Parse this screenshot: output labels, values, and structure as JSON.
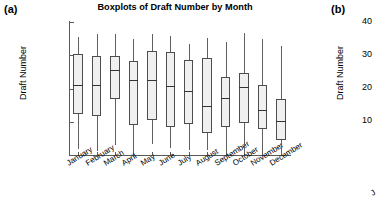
{
  "figure": {
    "panel_a_label": "(a)",
    "panel_b_label": "(b)"
  },
  "panel_a": {
    "title": "Boxplots of Draft Number by Month",
    "ylabel": "Draft Number"
  },
  "panel_b": {
    "ylabel": "Draft Number",
    "visible_ytick_labels": [
      "40",
      "30",
      "20",
      "10"
    ],
    "partial_xtick_label": "J"
  },
  "chart_data": {
    "type": "box",
    "title": "Boxplots of Draft Number by Month",
    "xlabel": "",
    "ylabel": "Draft Number",
    "ylim": [
      0,
      400
    ],
    "yticks": [
      0,
      100,
      200,
      300,
      400
    ],
    "ytick_labels": [
      "0",
      "100",
      "200",
      "300",
      "400"
    ],
    "grid": false,
    "legend": "none",
    "categories": [
      "January",
      "February",
      "March",
      "April",
      "May",
      "June",
      "July",
      "August",
      "September",
      "October",
      "November",
      "December"
    ],
    "boxes": [
      {
        "category": "January",
        "whisker_low": 17,
        "q1": 122,
        "median": 211,
        "q3": 305,
        "whisker_high": 355
      },
      {
        "category": "February",
        "whisker_low": 11,
        "q1": 118,
        "median": 210,
        "q3": 297,
        "whisker_high": 365
      },
      {
        "category": "March",
        "whisker_low": 29,
        "q1": 167,
        "median": 256,
        "q3": 298,
        "whisker_high": 364
      },
      {
        "category": "April",
        "whisker_low": 9,
        "q1": 90,
        "median": 225,
        "q3": 283,
        "whisker_high": 350
      },
      {
        "category": "May",
        "whisker_low": 34,
        "q1": 105,
        "median": 226,
        "q3": 314,
        "whisker_high": 363
      },
      {
        "category": "June",
        "whisker_low": 20,
        "q1": 84,
        "median": 209,
        "q3": 311,
        "whisker_high": 357
      },
      {
        "category": "July",
        "whisker_low": 16,
        "q1": 93,
        "median": 191,
        "q3": 285,
        "whisker_high": 334
      },
      {
        "category": "August",
        "whisker_low": 14,
        "q1": 66,
        "median": 147,
        "q3": 292,
        "whisker_high": 351
      },
      {
        "category": "September",
        "whisker_low": 8,
        "q1": 83,
        "median": 171,
        "q3": 234,
        "whisker_high": 339
      },
      {
        "category": "October",
        "whisker_low": 5,
        "q1": 97,
        "median": 204,
        "q3": 247,
        "whisker_high": 366
      },
      {
        "category": "November",
        "whisker_low": 10,
        "q1": 77,
        "median": 135,
        "q3": 212,
        "whisker_high": 350
      },
      {
        "category": "December",
        "whisker_low": 1,
        "q1": 46,
        "median": 103,
        "q3": 168,
        "whisker_high": 328
      }
    ],
    "colors": {
      "box_fill": "#f0f0f0",
      "box_edge": "#4d4d4d",
      "median": "#333333",
      "whisker": "#606060",
      "axis": "#5a5a5a",
      "text": "#000000",
      "background": "#ffffff"
    }
  }
}
